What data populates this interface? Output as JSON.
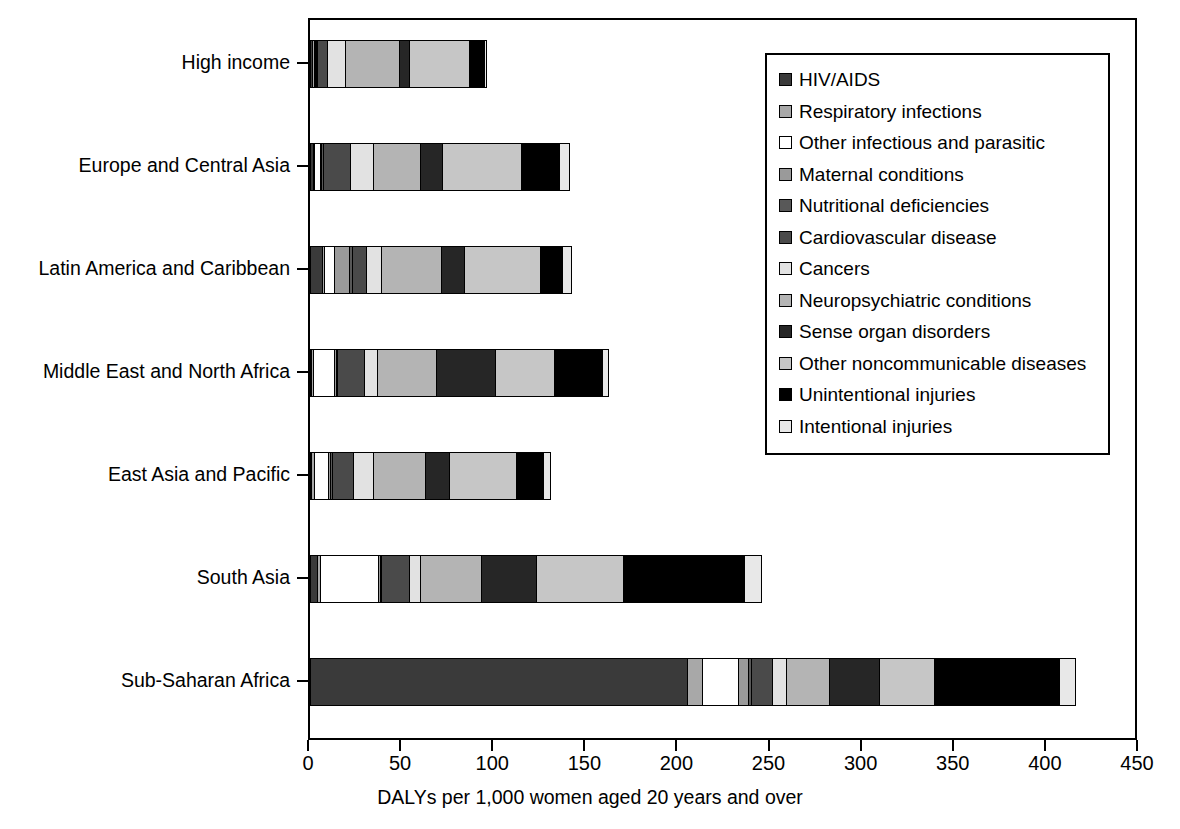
{
  "chart_data": {
    "type": "bar",
    "orientation": "horizontal",
    "stacked": true,
    "title": "",
    "xlabel": "DALYs per 1,000 women aged 20 years and over",
    "ylabel": "",
    "xlim": [
      0,
      450
    ],
    "xticks": [
      0,
      50,
      100,
      150,
      200,
      250,
      300,
      350,
      400,
      450
    ],
    "grid": false,
    "legend_position": "upper-right",
    "categories": [
      "High income",
      "Europe and Central Asia",
      "Latin America and Caribbean",
      "Middle East and North Africa",
      "East Asia and Pacific",
      "South Asia",
      "Sub-Saharan Africa"
    ],
    "series": [
      {
        "name": "HIV/AIDS",
        "color": "#3a3a3a",
        "values": [
          1.5,
          2.0,
          7.0,
          0.6,
          1.0,
          4.5,
          205.0
        ]
      },
      {
        "name": "Respiratory infections",
        "color": "#a8a8a8",
        "values": [
          1.5,
          1.5,
          1.5,
          1.5,
          2.0,
          2.0,
          9.0
        ]
      },
      {
        "name": "Other infectious and parasitic",
        "color": "#ffffff",
        "values": [
          1.0,
          3.5,
          6.0,
          12.0,
          8.5,
          32.0,
          20.0
        ]
      },
      {
        "name": "Maternal conditions",
        "color": "#9a9a9a",
        "values": [
          0.5,
          1.0,
          9.0,
          1.5,
          1.5,
          1.5,
          6.0
        ]
      },
      {
        "name": "Nutritional deficiencies",
        "color": "#585858",
        "values": [
          0.8,
          1.5,
          2.0,
          1.0,
          1.5,
          1.0,
          2.0
        ]
      },
      {
        "name": "Cardiovascular disease",
        "color": "#4a4a4a",
        "values": [
          6.0,
          15.5,
          8.0,
          15.5,
          12.0,
          16.0,
          12.0
        ]
      },
      {
        "name": "Cancers",
        "color": "#e2e2e2",
        "values": [
          10.5,
          13.0,
          9.0,
          7.5,
          11.5,
          6.5,
          8.0
        ]
      },
      {
        "name": "Neuropsychiatric conditions",
        "color": "#b4b4b4",
        "values": [
          30.0,
          26.0,
          33.0,
          32.5,
          28.5,
          33.5,
          24.0
        ]
      },
      {
        "name": "Sense organ disorders",
        "color": "#262626",
        "values": [
          6.0,
          12.5,
          13.0,
          32.5,
          14.0,
          30.5,
          28.0
        ]
      },
      {
        "name": "Other noncommunicable diseases",
        "color": "#c6c6c6",
        "values": [
          33.0,
          43.5,
          42.0,
          33.0,
          36.5,
          48.0,
          30.0
        ]
      },
      {
        "name": "Unintentional injuries",
        "color": "#000000",
        "values": [
          8.5,
          21.0,
          12.5,
          26.5,
          15.5,
          66.0,
          68.5
        ]
      },
      {
        "name": "Intentional injuries",
        "color": "#e8e8e8",
        "values": [
          2.0,
          6.0,
          5.0,
          3.5,
          4.0,
          10.0,
          9.5
        ]
      }
    ],
    "totals": [
      101.3,
      147.0,
      148.0,
      167.6,
      136.5,
      251.5,
      422.0
    ]
  },
  "axis": {
    "x_title": "DALYs per 1,000 women aged 20 years and over",
    "x_tick_labels": [
      "0",
      "50",
      "100",
      "150",
      "200",
      "250",
      "300",
      "350",
      "400",
      "450"
    ]
  },
  "legend": {
    "items": [
      "HIV/AIDS",
      "Respiratory infections",
      "Other infectious and parasitic",
      "Maternal conditions",
      "Nutritional deficiencies",
      "Cardiovascular disease",
      "Cancers",
      "Neuropsychiatric conditions",
      "Sense organ disorders",
      "Other noncommunicable diseases",
      "Unintentional injuries",
      "Intentional injuries"
    ]
  }
}
